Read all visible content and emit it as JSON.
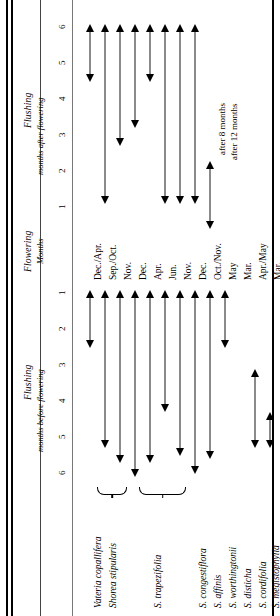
{
  "figure": {
    "title_flushing_after": "Flushing",
    "subtitle_flushing_after": "months after flowering",
    "title_flowering": "Flowering",
    "subtitle_flowering": "Months",
    "title_flushing_before": "Flushing",
    "subtitle_flushing_before": "months before flowering"
  },
  "axis": {
    "after_ticks": [
      "6",
      "5",
      "4",
      "3",
      "2",
      "1"
    ],
    "before_ticks": [
      "1",
      "2",
      "3",
      "4",
      "5",
      "6"
    ],
    "unit": "months"
  },
  "notes": [
    {
      "text": "after 8 months"
    },
    {
      "text": "after 12 months"
    }
  ],
  "species": [
    {
      "name": "Vateria copallifera",
      "flowering_month": "Dec./Apr."
    },
    {
      "name": "Shorea stipularis",
      "flowering_month": "Sep./Oct."
    },
    {
      "name": "",
      "flowering_month": "Nov."
    },
    {
      "name": "",
      "flowering_month": "Dec."
    },
    {
      "name": "S. trapezifolia",
      "flowering_month": "Apr."
    },
    {
      "name": "",
      "flowering_month": "Jun."
    },
    {
      "name": "",
      "flowering_month": "Nov."
    },
    {
      "name": "",
      "flowering_month": "Dec."
    },
    {
      "name": "S. congestiflora",
      "flowering_month": "Oct./Nov."
    },
    {
      "name": "S. affinis",
      "flowering_month": "May"
    },
    {
      "name": "S. worthingtonii",
      "flowering_month": "Mar."
    },
    {
      "name": "S. disticha",
      "flowering_month": "Apr./May"
    },
    {
      "name": "S. cordifolia",
      "flowering_month": "Mar."
    },
    {
      "name": "S. megistophylla",
      "flowering_month": "Mar./Apr."
    }
  ],
  "species_labels": [
    "Vateria copallifera",
    "Shorea stipularis",
    "S. trapezifolia",
    "S. congestiflora",
    "S. affinis",
    "S. worthingtonii",
    "S. disticha",
    "S. cordifolia",
    "S. megistophylla"
  ],
  "chart_data": {
    "type": "bar",
    "xlabel": "Species",
    "ylabel": "Months relative to flowering",
    "grid": false,
    "legend": "none",
    "ylim": [
      -6,
      6
    ],
    "axis_note": "Upper half = Flushing months after flowering (6..1); Lower half = Flushing months before flowering (1..6)",
    "categories": [
      "Vateria copallifera",
      "Shorea stipularis",
      "Shorea stipularis",
      "Shorea stipularis",
      "S. trapezifolia",
      "S. trapezifolia",
      "S. trapezifolia",
      "S. trapezifolia",
      "S. congestiflora",
      "S. affinis",
      "S. worthingtonii",
      "S. disticha",
      "S. cordifolia",
      "S. megistophylla"
    ],
    "flowering_months": [
      "Dec./Apr.",
      "Sep./Oct.",
      "Nov.",
      "Dec.",
      "Apr.",
      "Jun.",
      "Nov.",
      "Dec.",
      "Oct./Nov.",
      "May",
      "Mar.",
      "Apr./May",
      "Mar.",
      "Mar./Apr."
    ],
    "series": [
      {
        "name": "Flushing after flowering (months)",
        "units": "months after flowering",
        "ranges": [
          [
            6.0,
            4.4
          ],
          [
            6.0,
            1.0
          ],
          [
            6.0,
            2.6
          ],
          [
            6.0,
            3.1
          ],
          [
            6.0,
            4.4
          ],
          [
            6.0,
            1.0
          ],
          [
            6.0,
            1.0
          ],
          [
            6.0,
            1.0
          ],
          [
            2.2,
            0.3
          ],
          [
            null,
            null
          ],
          [
            null,
            null
          ],
          [
            null,
            null
          ],
          [
            null,
            null
          ],
          [
            1.9,
            0.3
          ]
        ]
      },
      {
        "name": "Flushing before flowering (months)",
        "units": "months before flowering",
        "ranges": [
          [
            1.0,
            2.6
          ],
          [
            1.0,
            5.4
          ],
          [
            1.0,
            5.8
          ],
          [
            1.0,
            6.2
          ],
          [
            1.0,
            5.8
          ],
          [
            1.0,
            4.4
          ],
          [
            1.0,
            5.6
          ],
          [
            1.0,
            6.1
          ],
          [
            1.0,
            5.7
          ],
          [
            1.0,
            2.6
          ],
          [
            null,
            null
          ],
          [
            3.2,
            5.4
          ],
          [
            4.4,
            5.4
          ],
          [
            4.4,
            5.4
          ]
        ]
      }
    ],
    "annotations": [
      {
        "label": "after 8 months",
        "attached_to": "S. affinis"
      },
      {
        "label": "after 12 months",
        "attached_to": "S. worthingtonii"
      }
    ],
    "groupings": [
      {
        "label": "Shorea stipularis",
        "members": [
          "Nov.",
          "Dec."
        ]
      },
      {
        "label": "S. trapezifolia",
        "members": [
          "Jun.",
          "Nov.",
          "Dec."
        ]
      }
    ]
  }
}
